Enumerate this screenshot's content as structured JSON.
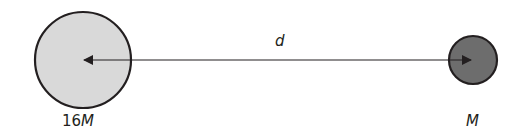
{
  "diagram": {
    "large_mass": {
      "label_num": "16",
      "label_var": "M",
      "fill": "#d9d9d9",
      "stroke": "#231f20"
    },
    "small_mass": {
      "label_num": "",
      "label_var": "M",
      "fill": "#6d6d6d",
      "stroke": "#231f20"
    },
    "distance": {
      "label": "d"
    }
  }
}
